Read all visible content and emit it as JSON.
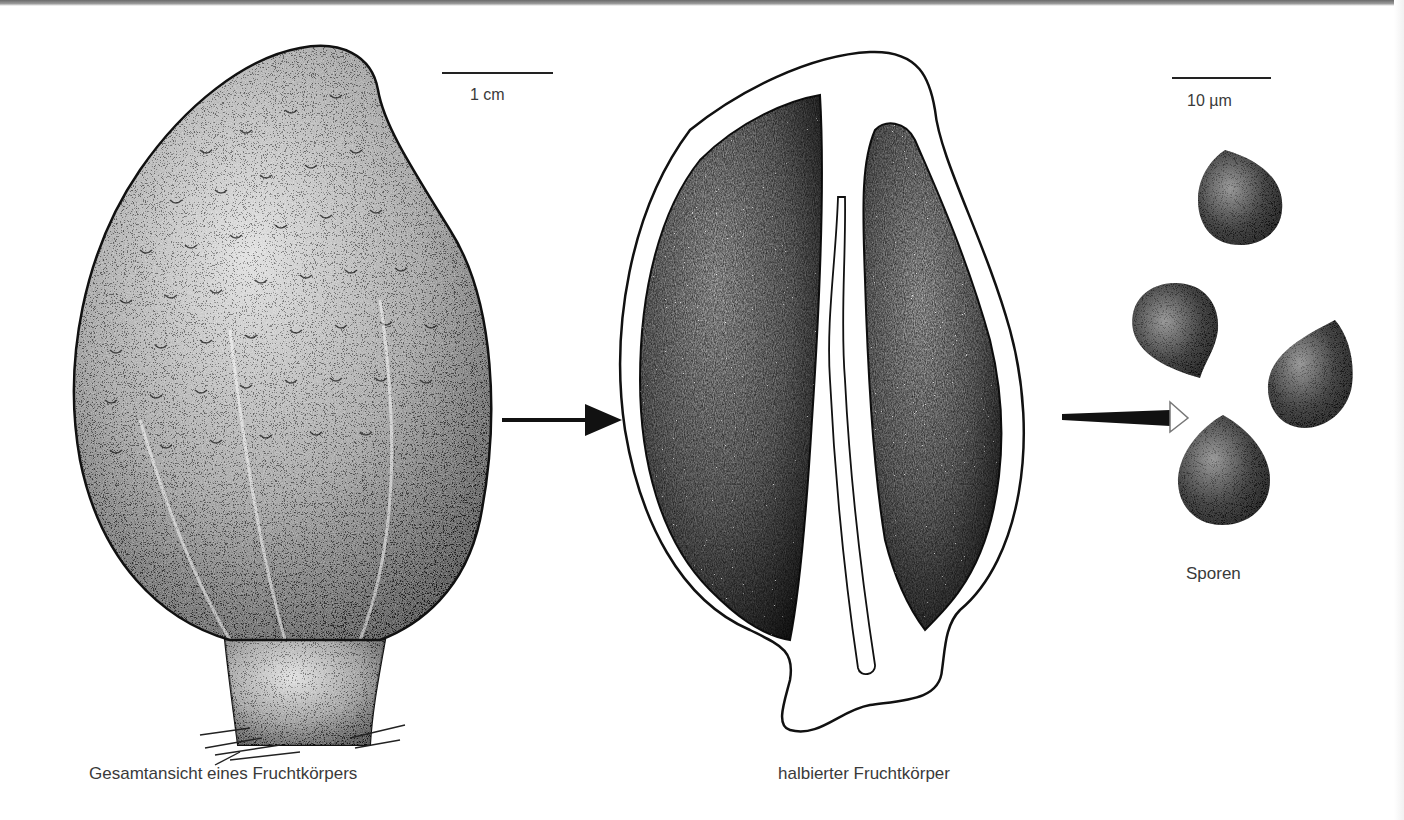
{
  "figure": {
    "panels": [
      {
        "id": "whole",
        "caption": "Gesamtansicht eines Fruchtkörpers"
      },
      {
        "id": "halved",
        "caption": "halbierter Fruchtkörper"
      },
      {
        "id": "spores",
        "caption": "Sporen"
      }
    ],
    "scale_bars": [
      {
        "label": "1 cm"
      },
      {
        "label": "10 µm"
      }
    ],
    "arrows": [
      {
        "from": "whole",
        "to": "halved",
        "style": "filled-head"
      },
      {
        "from": "halved",
        "to": "spores",
        "style": "open-head"
      }
    ],
    "spore_count": 4,
    "colors": {
      "ink": "#111111",
      "background": "#ffffff",
      "text": "#3a3a3a"
    }
  }
}
